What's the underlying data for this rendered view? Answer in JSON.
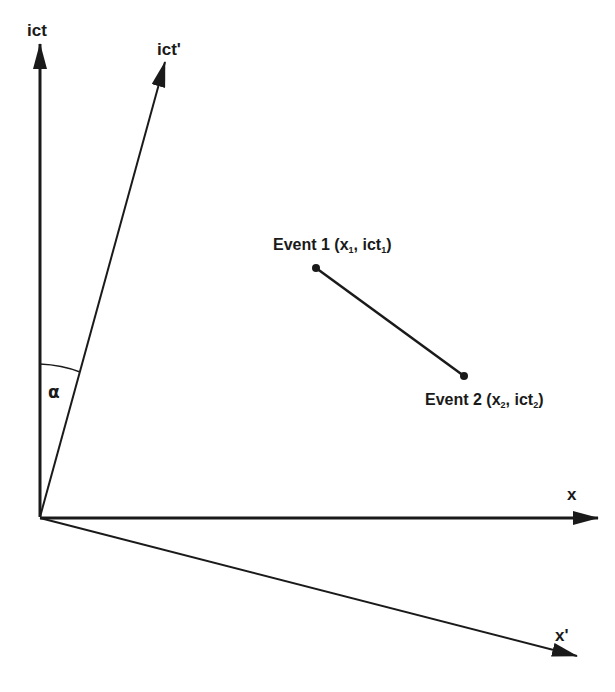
{
  "diagram": {
    "axes": {
      "ict": {
        "label": "ict"
      },
      "ict_prime": {
        "label": "ict'"
      },
      "x": {
        "label": "x"
      },
      "x_prime": {
        "label": "x'"
      }
    },
    "angle": {
      "label": "α"
    },
    "events": [
      {
        "name": "Event 1",
        "prefix": "Event 1 (",
        "x": "x",
        "x_sub": "1",
        "sep": ", ",
        "t": "ict",
        "t_sub": "1",
        "suffix": ")"
      },
      {
        "name": "Event 2",
        "prefix": "Event 2 (",
        "x": "x",
        "x_sub": "2",
        "sep": ", ",
        "t": "ict",
        "t_sub": "2",
        "suffix": ")"
      }
    ],
    "colors": {
      "stroke": "#1a1a1a",
      "background": "#ffffff"
    }
  }
}
